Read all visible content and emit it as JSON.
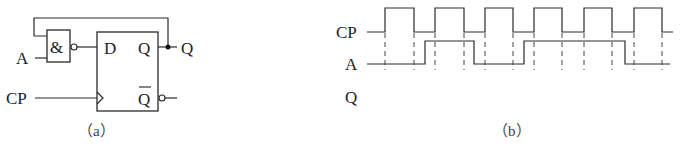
{
  "circuit": {
    "caption": "（a）",
    "input_a_label": "A",
    "input_cp_label": "CP",
    "gate_symbol": "&",
    "gate_type": "NAND",
    "ff_d_label": "D",
    "ff_q_label": "Q",
    "ff_qbar_label": "Q",
    "output_q_label": "Q"
  },
  "timing": {
    "caption": "（b）",
    "signals": [
      {
        "name": "CP",
        "label": "CP"
      },
      {
        "name": "A",
        "label": "A"
      },
      {
        "name": "Q",
        "label": "Q"
      }
    ],
    "cp_rising_edges_x": [
      385,
      435,
      485,
      534,
      584,
      634
    ],
    "cp_falling_edges_x": [
      414,
      464,
      513,
      562,
      612,
      662
    ],
    "a_transitions": [
      {
        "x": 425,
        "to": 1
      },
      {
        "x": 474,
        "to": 0
      },
      {
        "x": 524,
        "to": 1
      },
      {
        "x": 625,
        "to": 0
      }
    ],
    "q_waveform": "blank (to be drawn)"
  }
}
